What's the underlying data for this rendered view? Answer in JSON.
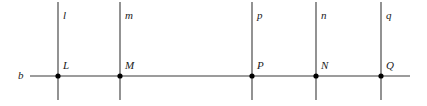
{
  "figure": {
    "background_color": "#ffffff",
    "stroke_color": "#3a3a3a",
    "point_color": "#000000",
    "label_color": "#1a1a1a",
    "width": 427,
    "height": 106,
    "baseline": {
      "name": "b",
      "label": "b",
      "label_x": 18,
      "label_y": 70,
      "y": 76,
      "x_start": 30,
      "x_end": 410
    },
    "vertical_lines": [
      {
        "label": "l",
        "x": 58,
        "y_top": 2,
        "y_bottom": 100,
        "label_x": 63,
        "label_y": 10
      },
      {
        "label": "m",
        "x": 120,
        "y_top": 2,
        "y_bottom": 100,
        "label_x": 125,
        "label_y": 10
      },
      {
        "label": "p",
        "x": 252,
        "y_top": 2,
        "y_bottom": 100,
        "label_x": 257,
        "label_y": 10
      },
      {
        "label": "n",
        "x": 316,
        "y_top": 2,
        "y_bottom": 100,
        "label_x": 321,
        "label_y": 10
      },
      {
        "label": "q",
        "x": 381,
        "y_top": 2,
        "y_bottom": 100,
        "label_x": 386,
        "label_y": 10
      }
    ],
    "points": [
      {
        "label": "L",
        "x": 58,
        "y": 76,
        "label_x": 63,
        "label_y": 60
      },
      {
        "label": "M",
        "x": 120,
        "y": 76,
        "label_x": 125,
        "label_y": 60
      },
      {
        "label": "P",
        "x": 252,
        "y": 76,
        "label_x": 257,
        "label_y": 60
      },
      {
        "label": "N",
        "x": 316,
        "y": 76,
        "label_x": 321,
        "label_y": 60
      },
      {
        "label": "Q",
        "x": 381,
        "y": 76,
        "label_x": 386,
        "label_y": 60
      }
    ]
  }
}
